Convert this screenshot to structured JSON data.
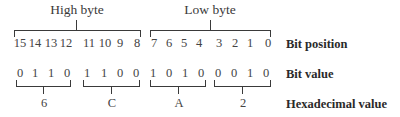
{
  "title_high": "High byte",
  "title_low": "Low byte",
  "bit_positions": [
    "15",
    "14",
    "13",
    "12",
    "11",
    "10",
    "9",
    "8",
    "7",
    "6",
    "5",
    "4",
    "3",
    "2",
    "1",
    "0"
  ],
  "bit_values": [
    "0",
    "1",
    "1",
    "0",
    "1",
    "1",
    "0",
    "0",
    "1",
    "0",
    "1",
    "0",
    "0",
    "0",
    "1",
    "0"
  ],
  "hex_digits": [
    "6",
    "C",
    "A",
    "2"
  ],
  "labels": {
    "bit_position": "Bit position",
    "bit_value": "Bit value",
    "hex_value": "Hexadecimal value"
  },
  "colors": {
    "ink": "#3a3a3a",
    "background": "#ffffff"
  }
}
